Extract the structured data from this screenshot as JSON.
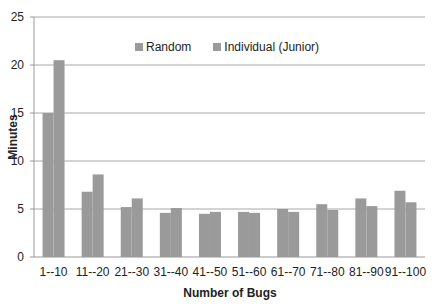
{
  "chart_data": {
    "type": "bar",
    "title": "",
    "xlabel": "Number of Bugs",
    "ylabel": "Minutes",
    "ylim": [
      0,
      25
    ],
    "yticks": [
      0,
      5,
      10,
      15,
      20,
      25
    ],
    "grid": true,
    "legend_position": "top-inside",
    "categories": [
      "1--10",
      "11--20",
      "21--30",
      "31--40",
      "41--50",
      "51--60",
      "61--70",
      "71--80",
      "81--90",
      "91--100"
    ],
    "series": [
      {
        "name": "Random",
        "color": "#9a9a9a",
        "values": [
          15.0,
          6.8,
          5.2,
          4.6,
          4.5,
          4.7,
          5.0,
          5.5,
          6.1,
          6.9
        ]
      },
      {
        "name": "Individual (Junior)",
        "color": "#9a9a9a",
        "values": [
          20.5,
          8.6,
          6.1,
          5.1,
          4.7,
          4.6,
          4.7,
          4.9,
          5.3,
          5.7
        ]
      }
    ]
  },
  "legend": {
    "items": [
      {
        "label": "Random",
        "color": "#9a9a9a"
      },
      {
        "label": "Individual (Junior)",
        "color": "#9a9a9a"
      }
    ]
  }
}
